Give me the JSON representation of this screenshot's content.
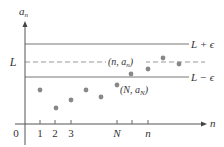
{
  "figure": {
    "y_axis_label": "a",
    "y_axis_label_sub": "n",
    "x_axis_label": "n",
    "origin_label": "0",
    "limit_label": "L",
    "upper_band_label": "L + ϵ",
    "lower_band_label": "L − ϵ",
    "point_n_label_prefix": "(n, a",
    "point_n_label_sub": "n",
    "point_n_label_suffix": ")",
    "point_N_label_prefix": "(N, a",
    "point_N_label_sub": "N",
    "point_N_label_suffix": ")",
    "x_ticks": [
      {
        "label": "1",
        "x": 40
      },
      {
        "label": "2",
        "x": 55
      },
      {
        "label": "3",
        "x": 71
      },
      {
        "label": "N",
        "x": 117,
        "italic": true
      },
      {
        "label": "",
        "x": 132
      },
      {
        "label": "n",
        "x": 148,
        "italic": true
      }
    ],
    "points": [
      {
        "x": 40,
        "y": 90
      },
      {
        "x": 56,
        "y": 108
      },
      {
        "x": 71,
        "y": 100
      },
      {
        "x": 86,
        "y": 90
      },
      {
        "x": 101,
        "y": 97
      },
      {
        "x": 117,
        "y": 85
      },
      {
        "x": 131,
        "y": 74
      },
      {
        "x": 148,
        "y": 69
      },
      {
        "x": 163,
        "y": 58
      },
      {
        "x": 179,
        "y": 64
      }
    ],
    "colors": {
      "axis": "#555555",
      "band_line": "#777777",
      "dashed_line": "#999999",
      "point": "#888888",
      "text": "#333333"
    }
  }
}
